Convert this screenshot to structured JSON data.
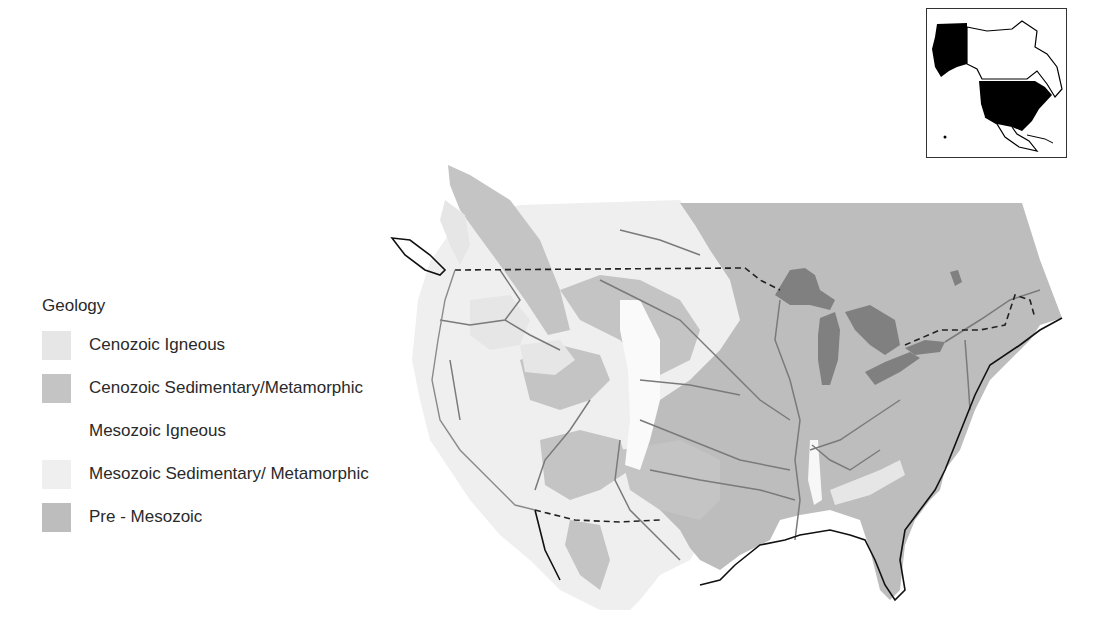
{
  "legend": {
    "title": "Geology",
    "items": [
      {
        "label": "Cenozoic Igneous",
        "color": "#e6e6e6"
      },
      {
        "label": "Cenozoic Sedimentary/Metamorphic",
        "color": "#c4c4c4"
      },
      {
        "label": "Mesozoic Igneous",
        "color": "#ffffff"
      },
      {
        "label": "Mesozoic Sedimentary/ Metamorphic",
        "color": "#efefef"
      },
      {
        "label": "Pre - Mesozoic",
        "color": "#bdbdbd"
      }
    ]
  },
  "map": {
    "region": "Contiguous United States with adjacent Canada and northern Mexico",
    "features": [
      "geologic-units",
      "rivers",
      "great-lakes",
      "international-border-dashed",
      "coastline"
    ],
    "colors": {
      "pre_mesozoic": "#bdbdbd",
      "cenozoic_sedimentary": "#c4c4c4",
      "cenozoic_igneous": "#e6e6e6",
      "mesozoic_sedimentary": "#efefef",
      "lakes": "#808080",
      "rivers": "#7a7a7a",
      "border": "#222222"
    }
  },
  "inset": {
    "description": "North America locator map with United States highlighted in black"
  }
}
